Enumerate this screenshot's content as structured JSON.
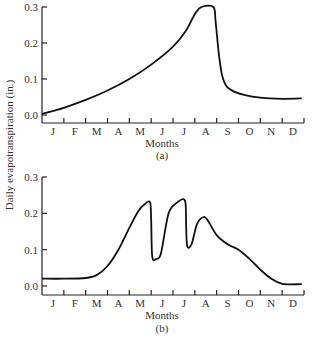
{
  "shared_ylabel": "Daily evapotranspiration (in.)",
  "chart_data": [
    {
      "type": "line",
      "panel_label": "(a)",
      "xlabel": "Months",
      "ylabel": "Daily evapotranspiration (in.)",
      "x_tick_labels": [
        "J",
        "F",
        "M",
        "A",
        "M",
        "J",
        "J",
        "A",
        "S",
        "O",
        "N",
        "D"
      ],
      "y_tick_labels": [
        "0.0",
        "0.1",
        "0.2",
        "0.3"
      ],
      "y_ticks": [
        0.0,
        0.1,
        0.2,
        0.3
      ],
      "xlim": [
        0,
        12
      ],
      "ylim": [
        0,
        0.3
      ],
      "x_units": "months since Jan 1",
      "grid": false,
      "series": [
        {
          "name": "evapotranspiration",
          "x": [
            0,
            1,
            2,
            3,
            4,
            5,
            6,
            6.6,
            7.0,
            7.3,
            7.85,
            7.95,
            8.1,
            8.25,
            8.45,
            8.8,
            9.3,
            10,
            11,
            11.9
          ],
          "y": [
            0.003,
            0.02,
            0.042,
            0.068,
            0.1,
            0.14,
            0.19,
            0.235,
            0.28,
            0.3,
            0.3,
            0.26,
            0.17,
            0.11,
            0.08,
            0.065,
            0.055,
            0.048,
            0.045,
            0.046
          ]
        }
      ]
    },
    {
      "type": "line",
      "panel_label": "(b)",
      "xlabel": "Months",
      "ylabel": "Daily evapotranspiration (in.)",
      "x_tick_labels": [
        "J",
        "F",
        "M",
        "A",
        "M",
        "J",
        "J",
        "A",
        "S",
        "O",
        "N",
        "D"
      ],
      "y_tick_labels": [
        "0.0",
        "0.1",
        "0.2",
        "0.3"
      ],
      "y_ticks": [
        0.0,
        0.1,
        0.2,
        0.3
      ],
      "xlim": [
        0,
        12
      ],
      "ylim": [
        0,
        0.3
      ],
      "x_units": "months since Jan 1",
      "grid": false,
      "series": [
        {
          "name": "evapotranspiration",
          "x": [
            0,
            1,
            2,
            2.5,
            3,
            3.5,
            4,
            4.4,
            4.7,
            4.95,
            5.0,
            5.05,
            5.25,
            5.45,
            5.8,
            6.2,
            6.55,
            6.6,
            6.65,
            6.85,
            7.1,
            7.4,
            7.6,
            8.0,
            8.5,
            9.0,
            9.5,
            10,
            10.5,
            11,
            11.9
          ],
          "y": [
            0.02,
            0.02,
            0.022,
            0.03,
            0.055,
            0.1,
            0.16,
            0.205,
            0.225,
            0.23,
            0.18,
            0.08,
            0.075,
            0.09,
            0.2,
            0.23,
            0.235,
            0.17,
            0.11,
            0.115,
            0.17,
            0.19,
            0.18,
            0.14,
            0.115,
            0.1,
            0.075,
            0.045,
            0.02,
            0.006,
            0.005
          ]
        }
      ]
    }
  ]
}
